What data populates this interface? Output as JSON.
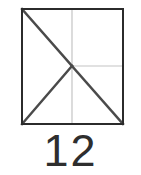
{
  "figure": {
    "caption": "12",
    "background_color": "#ffffff",
    "canvas": {
      "width": 141,
      "height": 175
    },
    "square": {
      "name": "outer-square",
      "x": 22,
      "y": 9,
      "width": 101,
      "height": 115,
      "stroke_color": "#2b2b2b",
      "stroke_width": 2,
      "fill": "none"
    },
    "solid_lines": [
      {
        "name": "diagonal-top-left-to-center",
        "x1": 22,
        "y1": 9,
        "x2": 72,
        "y2": 66,
        "stroke_color": "#4a4a4a",
        "stroke_width": 2.4
      },
      {
        "name": "diagonal-center-to-bottom-left",
        "x1": 72,
        "y1": 66,
        "x2": 22,
        "y2": 124,
        "stroke_color": "#4a4a4a",
        "stroke_width": 2.4
      },
      {
        "name": "diagonal-center-to-bottom-right",
        "x1": 72,
        "y1": 66,
        "x2": 123,
        "y2": 124,
        "stroke_color": "#4a4a4a",
        "stroke_width": 2.4
      }
    ],
    "faint_lines": [
      {
        "name": "vertical-midline",
        "x1": 72,
        "y1": 9,
        "x2": 72,
        "y2": 124,
        "stroke_color": "#c4c4c4",
        "stroke_width": 1.2
      },
      {
        "name": "horizontal-midline-right-half",
        "x1": 72,
        "y1": 66,
        "x2": 123,
        "y2": 66,
        "stroke_color": "#c4c4c4",
        "stroke_width": 1.2
      }
    ],
    "center_point": {
      "name": "center-vertex",
      "x": 72,
      "y": 66
    }
  }
}
